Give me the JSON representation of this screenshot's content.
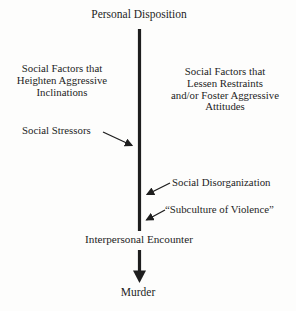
{
  "colors": {
    "ink": "#1e1e1e",
    "paper": "#fdfdfc"
  },
  "diagram": {
    "title": "Personal Disposition",
    "left_factors": "Social Factors that\nHeighten Aggressive\nInclinations",
    "right_factors": "Social Factors that\nLessen Restraints\nand/or Foster Aggressive\nAttitudes",
    "social_stressors": "Social Stressors",
    "social_disorganization": "Social Disorganization",
    "subculture_of_violence": "“Subculture of Violence”",
    "interpersonal_encounter": "Interpersonal Encounter",
    "murder": "Murder"
  }
}
